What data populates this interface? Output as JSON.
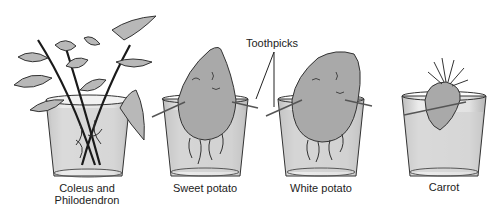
{
  "figure": {
    "callout": "Toothpicks",
    "containers": [
      {
        "id": "coleus",
        "label_line1": "Coleus and",
        "label_line2": "Philodendron"
      },
      {
        "id": "sweet-potato",
        "label_line1": "Sweet potato"
      },
      {
        "id": "white-potato",
        "label_line1": "White potato"
      },
      {
        "id": "carrot",
        "label_line1": "Carrot"
      }
    ]
  },
  "colors": {
    "line": "#2a2a2a",
    "glass": "#e4e4e4",
    "water": "#c8c8c8",
    "leaf": "#b8b8b8",
    "tuber": "#a8a8a8"
  }
}
